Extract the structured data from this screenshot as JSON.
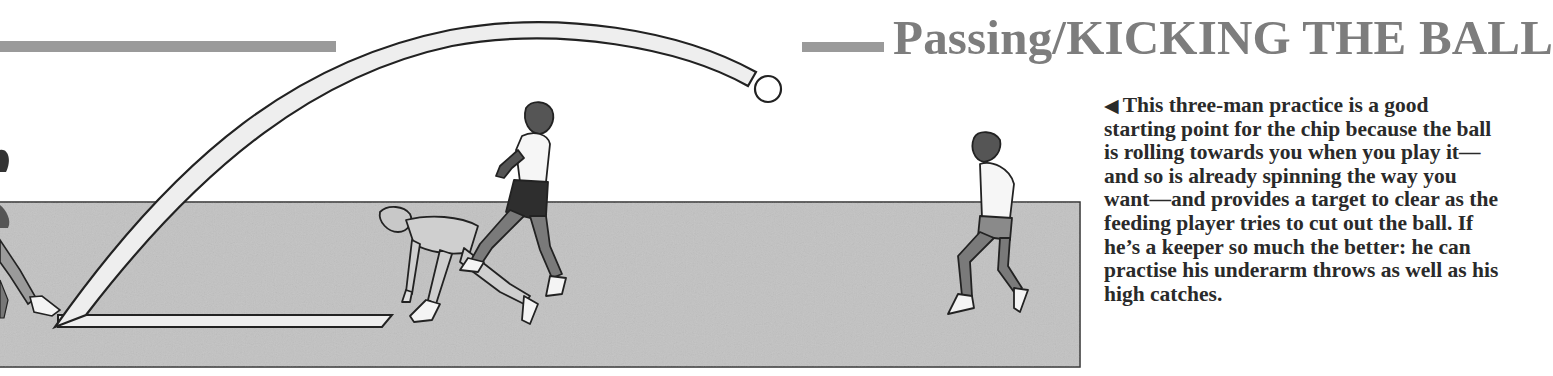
{
  "header": {
    "title": "Passing/KICKING THE BALL"
  },
  "caption": {
    "arrow_icon": "◀",
    "text": "This three-man practice is a good starting point for the chip because the ball is rolling towards you when you play it—and so is already spinning the way you want—and provides a target to clear as the feeding player tries to cut out the ball. If he’s a keeper so much the better: he can practise his underarm throws as well as his high catches."
  },
  "illustration": {
    "description": "Three-man chip practice drill on a grey pitch strip",
    "players": [
      "chipping player (left, partially cropped)",
      "feeding player (crouched, centre)",
      "keeper jumping (centre)",
      "receiving player (right)"
    ],
    "colors": {
      "pitch": "#c2c2c2",
      "rule": "#9a9a9a",
      "title": "#7d7d7d",
      "text": "#2a2a2a",
      "outline": "#222222"
    }
  }
}
